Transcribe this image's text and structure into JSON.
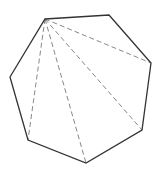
{
  "diagram": {
    "type": "heptagon-diagonals",
    "vertices": [
      {
        "id": "A",
        "x": 45,
        "y": 19
      },
      {
        "id": "B",
        "x": 109,
        "y": 15
      },
      {
        "id": "C",
        "x": 151,
        "y": 63
      },
      {
        "id": "D",
        "x": 142,
        "y": 130
      },
      {
        "id": "E",
        "x": 86,
        "y": 163
      },
      {
        "id": "F",
        "x": 28,
        "y": 140
      },
      {
        "id": "G",
        "x": 10,
        "y": 77
      }
    ],
    "diagonals_from": "A",
    "diagonals": [
      {
        "from": "A",
        "to": "C"
      },
      {
        "from": "A",
        "to": "D"
      },
      {
        "from": "A",
        "to": "E"
      },
      {
        "from": "A",
        "to": "F"
      }
    ],
    "colors": {
      "edge": "#333333",
      "diagonal": "#888888",
      "background": "#ffffff"
    }
  }
}
